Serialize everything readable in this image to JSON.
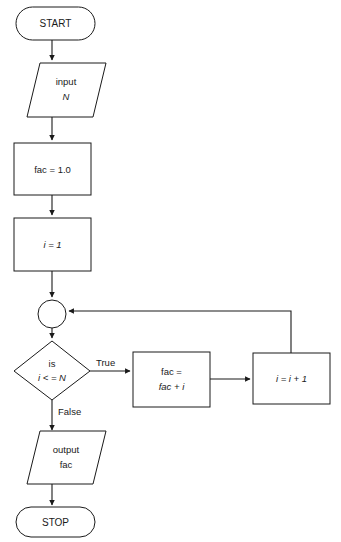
{
  "diagram": {
    "background_color": "#ffffff",
    "line_color": "#1a1a1a",
    "text_color": "#1a1a1a"
  },
  "nodes": {
    "start": {
      "label": "START",
      "shape": "terminator"
    },
    "input": {
      "line1": "input",
      "line2": "N",
      "shape": "parallelogram"
    },
    "init_fac": {
      "label": "fac = 1.0",
      "shape": "process"
    },
    "init_i": {
      "label": "i = 1",
      "shape": "process"
    },
    "connector": {
      "label": "",
      "shape": "circle"
    },
    "decision": {
      "line1": "is",
      "line2": "i < = N",
      "shape": "diamond"
    },
    "accumulate": {
      "line1": "fac =",
      "line2": "fac + i",
      "shape": "process"
    },
    "increment": {
      "label": "i = i + 1",
      "shape": "process"
    },
    "output": {
      "line1": "output",
      "line2": "fac",
      "shape": "parallelogram"
    },
    "stop": {
      "label": "STOP",
      "shape": "terminator"
    }
  },
  "edge_labels": {
    "true_branch": "True",
    "false_branch": "False"
  }
}
